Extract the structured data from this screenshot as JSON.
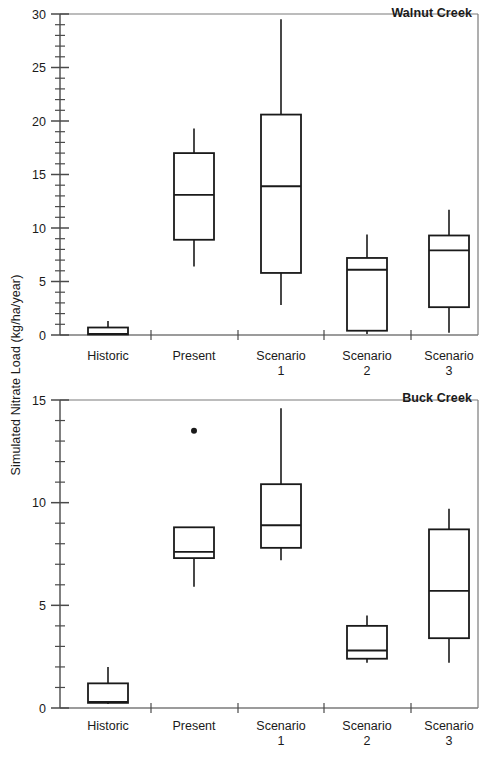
{
  "figure": {
    "ylabel": "Simulated Nitrate Load (kg/ha/year)",
    "categories": [
      "Historic",
      "Present",
      "Scenario 1",
      "Scenario 2",
      "Scenario 3"
    ],
    "category_lines": [
      {
        "l1": "Historic",
        "l2": ""
      },
      {
        "l1": "Present",
        "l2": ""
      },
      {
        "l1": "Scenario",
        "l2": "1"
      },
      {
        "l1": "Scenario",
        "l2": "2"
      },
      {
        "l1": "Scenario",
        "l2": "3"
      }
    ],
    "line_color": "#1a1a1a",
    "fill_color": "#ffffff"
  },
  "panels": [
    {
      "name": "walnut-creek",
      "title": "Walnut Creek",
      "ylim": [
        0,
        30
      ],
      "ymajor": [
        0,
        5,
        10,
        15,
        20,
        25,
        30
      ],
      "yminor_step": 1,
      "ytick_labels": [
        "0",
        "5",
        "10",
        "15",
        "20",
        "25",
        "30"
      ]
    },
    {
      "name": "buck-creek",
      "title": "Buck Creek",
      "ylim": [
        0,
        15
      ],
      "ymajor": [
        0,
        5,
        10,
        15
      ],
      "yminor_step": 1,
      "ytick_labels": [
        "0",
        "5",
        "10",
        "15"
      ]
    }
  ],
  "chart_data": {
    "type": "box",
    "title": "",
    "xlabel": "",
    "ylabel": "Simulated Nitrate Load (kg/ha/year)",
    "grid": false,
    "legend": "none",
    "categories": [
      "Historic",
      "Present",
      "Scenario 1",
      "Scenario 2",
      "Scenario 3"
    ],
    "panels": [
      {
        "panel_label": "Walnut Creek",
        "ylim": [
          0,
          30
        ],
        "yticks": [
          0,
          5,
          10,
          15,
          20,
          25,
          30
        ],
        "boxes": [
          {
            "category": "Historic",
            "whisker_low": 0.0,
            "q1": 0.05,
            "median": 0.1,
            "q3": 0.7,
            "whisker_high": 1.3,
            "outliers": []
          },
          {
            "category": "Present",
            "whisker_low": 6.4,
            "q1": 8.9,
            "median": 13.1,
            "q3": 17.0,
            "whisker_high": 19.3,
            "outliers": []
          },
          {
            "category": "Scenario 1",
            "whisker_low": 2.8,
            "q1": 5.8,
            "median": 13.9,
            "q3": 20.6,
            "whisker_high": 29.5,
            "outliers": []
          },
          {
            "category": "Scenario 2",
            "whisker_low": 0.1,
            "q1": 0.4,
            "median": 6.1,
            "q3": 7.2,
            "whisker_high": 9.4,
            "outliers": []
          },
          {
            "category": "Scenario 3",
            "whisker_low": 0.2,
            "q1": 2.6,
            "median": 7.9,
            "q3": 9.3,
            "whisker_high": 11.7,
            "outliers": []
          }
        ]
      },
      {
        "panel_label": "Buck Creek",
        "ylim": [
          0,
          15
        ],
        "yticks": [
          0,
          5,
          10,
          15
        ],
        "boxes": [
          {
            "category": "Historic",
            "whisker_low": 0.2,
            "q1": 0.25,
            "median": 0.3,
            "q3": 1.2,
            "whisker_high": 2.0,
            "outliers": []
          },
          {
            "category": "Present",
            "whisker_low": 5.9,
            "q1": 7.3,
            "median": 7.6,
            "q3": 8.8,
            "whisker_high": 8.8,
            "outliers": [
              13.5
            ]
          },
          {
            "category": "Scenario 1",
            "whisker_low": 7.2,
            "q1": 7.8,
            "median": 8.9,
            "q3": 10.9,
            "whisker_high": 14.6,
            "outliers": []
          },
          {
            "category": "Scenario 2",
            "whisker_low": 2.2,
            "q1": 2.4,
            "median": 2.8,
            "q3": 4.0,
            "whisker_high": 4.5,
            "outliers": []
          },
          {
            "category": "Scenario 3",
            "whisker_low": 2.2,
            "q1": 3.4,
            "median": 5.7,
            "q3": 8.7,
            "whisker_high": 9.7,
            "outliers": []
          }
        ]
      }
    ]
  }
}
